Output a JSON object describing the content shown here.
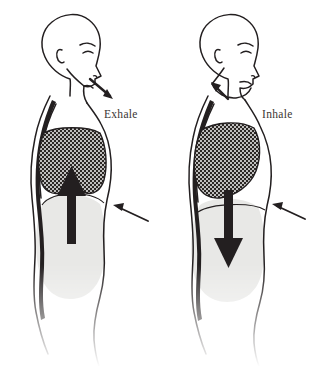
{
  "diagram": {
    "background_color": "#ffffff",
    "ink_color": "#231f20",
    "lung_fill_color": "#2b2724",
    "lung_stipple_color": "#ffffff",
    "abdomen_fill_color": "#e8e8e6",
    "label_color": "#3a3532",
    "figure_count": 2
  },
  "figures": [
    {
      "id": "exhale-figure",
      "label": "Exhale",
      "label_position": {
        "x": 104,
        "y": 118
      },
      "phase": "exhale",
      "head_direction": "right-facing-profile",
      "airflow": {
        "name": "airflow-arrow",
        "direction": "outward-down-right",
        "from": "nose",
        "description": "Air leaving the nostrils"
      },
      "diaphragm": {
        "name": "diaphragm-arrow",
        "direction": "up",
        "description": "Diaphragm moves upward, pushing air out of the lungs"
      },
      "pointer": {
        "name": "diaphragm-pointer-arrow",
        "direction": "up-left",
        "points_to": "diaphragm"
      },
      "lungs": {
        "state": "deflated",
        "description": "Lungs contracted and smaller"
      },
      "abdomen": {
        "state": "drawn-in",
        "description": "Abdomen pulled inward"
      }
    },
    {
      "id": "inhale-figure",
      "label": "Inhale",
      "label_position": {
        "x": 262,
        "y": 118
      },
      "phase": "inhale",
      "head_direction": "right-facing-profile",
      "airflow": {
        "name": "airflow-arrow",
        "direction": "inward-up-left",
        "from": "nose",
        "description": "Air entering through the nostrils"
      },
      "diaphragm": {
        "name": "diaphragm-arrow",
        "direction": "down",
        "description": "Diaphragm moves downward, drawing air into the lungs"
      },
      "pointer": {
        "name": "diaphragm-pointer-arrow",
        "direction": "up-left",
        "points_to": "diaphragm"
      },
      "lungs": {
        "state": "inflated",
        "description": "Lungs expanded and filled with air"
      },
      "abdomen": {
        "state": "expanded",
        "description": "Abdomen pushed outward"
      }
    }
  ]
}
